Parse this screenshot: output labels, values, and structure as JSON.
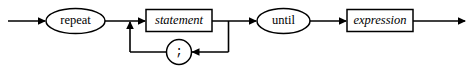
{
  "diagram": {
    "kind": "railroad-syntax-diagram",
    "background_color": "#ffffff",
    "line_color": "#000000",
    "fill_color": "#ffffff",
    "baseline_y": 21,
    "loop_y": 52,
    "nodes": [
      {
        "id": "repeat",
        "label": "repeat",
        "shape": "ellipse",
        "role": "terminal",
        "cx": 75.5,
        "cy": 21,
        "rx": 29.5,
        "ry": 12.5
      },
      {
        "id": "statement",
        "label": "statement",
        "shape": "rect",
        "role": "nonterminal",
        "x": 146,
        "y": 9.5,
        "width": 66,
        "height": 22
      },
      {
        "id": "semicolon",
        "label": ";",
        "shape": "circle",
        "role": "terminal",
        "cx": 179,
        "cy": 52,
        "r": 12.5
      },
      {
        "id": "until",
        "label": "until",
        "shape": "ellipse",
        "role": "terminal",
        "cx": 283.5,
        "cy": 21,
        "rx": 26.5,
        "ry": 12.5
      },
      {
        "id": "expression",
        "label": "expression",
        "shape": "rect",
        "role": "nonterminal",
        "x": 347,
        "y": 9.5,
        "width": 66,
        "height": 22
      }
    ],
    "edges": [
      {
        "id": "entry-to-repeat",
        "from": "start",
        "to": "repeat",
        "arrow": true
      },
      {
        "id": "repeat-to-statement",
        "from": "repeat",
        "to": "statement",
        "arrow": true
      },
      {
        "id": "statement-to-until",
        "from": "statement",
        "to": "until",
        "arrow": true
      },
      {
        "id": "until-to-expression",
        "from": "until",
        "to": "expression",
        "arrow": true
      },
      {
        "id": "expression-to-exit",
        "from": "expression",
        "to": "end",
        "arrow": true
      },
      {
        "id": "statement-down-right",
        "from": "statement",
        "to": "semicolon",
        "arrow": true
      },
      {
        "id": "semicolon-left-up",
        "from": "semicolon",
        "to": "statement",
        "arrow": true
      }
    ],
    "arrow_markers": [
      {
        "id": "arrow-entry",
        "x": 46,
        "y": 21,
        "dir": "right"
      },
      {
        "id": "arrow-statement-in",
        "x": 146,
        "y": 21,
        "dir": "right"
      },
      {
        "id": "arrow-until-in",
        "x": 257,
        "y": 21,
        "dir": "right"
      },
      {
        "id": "arrow-expression-in",
        "x": 347,
        "y": 21,
        "dir": "right"
      },
      {
        "id": "arrow-exit",
        "x": 466,
        "y": 21,
        "dir": "right"
      },
      {
        "id": "arrow-semicolon-in",
        "x": 191.5,
        "y": 52,
        "dir": "left"
      },
      {
        "id": "arrow-loopback-up",
        "x": 130,
        "y": 21,
        "dir": "up"
      }
    ]
  }
}
